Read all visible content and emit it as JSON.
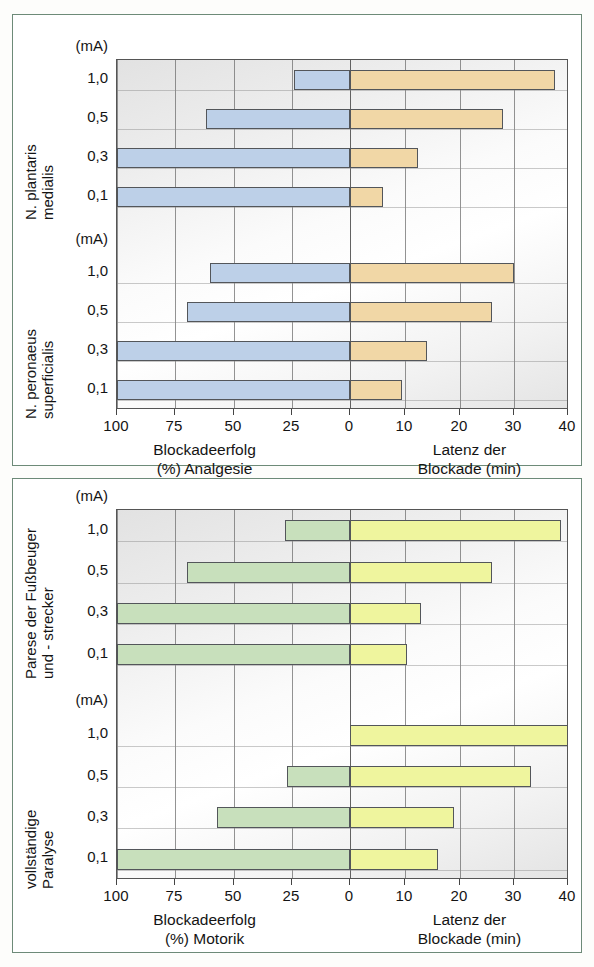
{
  "figure": {
    "panels": [
      {
        "id": "panel-sensory",
        "unit_label": "(mA)",
        "groups": [
          {
            "name_lines": [
              "N. plantaris",
              "medialis"
            ],
            "categories": [
              "1,0",
              "0,5",
              "0,3",
              "0,1"
            ],
            "block_success_percent": [
              24,
              62,
              100,
              100
            ],
            "latency_minutes": [
              37.5,
              28,
              12.5,
              6
            ]
          },
          {
            "name_lines": [
              "N. peronaeus",
              "superficialis"
            ],
            "categories": [
              "1,0",
              "0,5",
              "0,3",
              "0,1"
            ],
            "block_success_percent": [
              60,
              70,
              100,
              100
            ],
            "latency_minutes": [
              30,
              26,
              14,
              9.5
            ]
          }
        ],
        "left_axis_title": [
          "Blockadeerfolg",
          "(%) Analgesie"
        ],
        "right_axis_title": [
          "Latenz der",
          "Blockade (min)"
        ],
        "left_ticks": [
          "100",
          "75",
          "50",
          "25",
          "0"
        ],
        "right_ticks": [
          "10",
          "20",
          "30",
          "40"
        ]
      },
      {
        "id": "panel-motor",
        "unit_label": "(mA)",
        "groups": [
          {
            "name_lines": [
              "Parese der Fußbeuger",
              "und - strecker"
            ],
            "categories": [
              "1,0",
              "0,5",
              "0,3",
              "0,1"
            ],
            "block_success_percent": [
              28,
              70,
              100,
              100
            ],
            "latency_minutes": [
              38.5,
              26,
              13,
              10.5
            ]
          },
          {
            "name_lines": [
              "vollständige",
              "Paralyse"
            ],
            "categories": [
              "1,0",
              "0,5",
              "0,3",
              "0,1"
            ],
            "block_success_percent": [
              0,
              27,
              57,
              100
            ],
            "latency_minutes": [
              40,
              33,
              19,
              16
            ]
          }
        ],
        "left_axis_title": [
          "Blockadeerfolg",
          "(%) Motorik"
        ],
        "right_axis_title": [
          "Latenz der",
          "Blockade (min)"
        ],
        "left_ticks": [
          "100",
          "75",
          "50",
          "25",
          "0"
        ],
        "right_ticks": [
          "10",
          "20",
          "30",
          "40"
        ]
      }
    ]
  },
  "chart_data": {
    "type": "bar",
    "orientation": "horizontal-diverging",
    "title": "",
    "xlabel_left": "Blockadeerfolg (%) Analgesie / Motorik",
    "xlabel_right": "Latenz der Blockade (min)",
    "ylabel": "(mA)",
    "xlim_left": [
      100,
      0
    ],
    "xlim_right": [
      0,
      40
    ],
    "left_tick_values": [
      100,
      75,
      50,
      25,
      0
    ],
    "right_tick_values": [
      0,
      10,
      20,
      30,
      40
    ],
    "grid": true,
    "legend": "none",
    "colors": {
      "sensory_block_success": "#bdd0e8",
      "sensory_latency": "#f1d7a6",
      "motor_block_success": "#c8e0bc",
      "motor_latency": "#eff59e",
      "panel_border": "#6d8a78",
      "plot_border": "#555555"
    },
    "panels": [
      {
        "name": "Analgesie (sensorisch)",
        "left_axis": "Blockadeerfolg (%) Analgesie",
        "right_axis": "Latenz der Blockade (min)",
        "series": [
          {
            "group": "N. plantaris medialis",
            "categories": [
              "1,0",
              "0,5",
              "0,3",
              "0,1"
            ],
            "block_success_percent": [
              24,
              62,
              100,
              100
            ],
            "latency_minutes": [
              37.5,
              28,
              12.5,
              6
            ]
          },
          {
            "group": "N. peronaeus superficialis",
            "categories": [
              "1,0",
              "0,5",
              "0,3",
              "0,1"
            ],
            "block_success_percent": [
              60,
              70,
              100,
              100
            ],
            "latency_minutes": [
              30,
              26,
              14,
              9.5
            ]
          }
        ]
      },
      {
        "name": "Motorik",
        "left_axis": "Blockadeerfolg (%) Motorik",
        "right_axis": "Latenz der Blockade (min)",
        "series": [
          {
            "group": "Parese der Fußbeuger und - strecker",
            "categories": [
              "1,0",
              "0,5",
              "0,3",
              "0,1"
            ],
            "block_success_percent": [
              28,
              70,
              100,
              100
            ],
            "latency_minutes": [
              38.5,
              26,
              13,
              10.5
            ]
          },
          {
            "group": "vollständige Paralyse",
            "categories": [
              "1,0",
              "0,5",
              "0,3",
              "0,1"
            ],
            "block_success_percent": [
              0,
              27,
              57,
              100
            ],
            "latency_minutes": [
              40,
              33,
              19,
              16
            ]
          }
        ]
      }
    ]
  }
}
